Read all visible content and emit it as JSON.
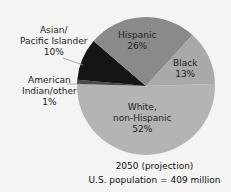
{
  "chart_data": {
    "type": "pie",
    "title": "2050 (projection)",
    "subtitle": "U.S. population = 409 million",
    "categories": [
      "White, non-Hispanic",
      "American Indian/other",
      "Asian/Pacific Islander",
      "Hispanic",
      "Black"
    ],
    "values": [
      52,
      1,
      10,
      26,
      13
    ],
    "unit": "%",
    "colors": [
      "#b4b4b4",
      "#4a4a4a",
      "#151515",
      "#8a8a8a",
      "#a9a9a9"
    ],
    "legend": "none (direct labels)"
  },
  "labels": {
    "white_line1": "White,",
    "white_line2": "non-Hispanic",
    "white_pct": "52%",
    "hispanic_line1": "Hispanic",
    "hispanic_pct": "26%",
    "black_line1": "Black",
    "black_pct": "13%",
    "asian_line1": "Asian/",
    "asian_line2": "Pacific Islander",
    "asian_pct": "10%",
    "amind_line1": "American",
    "amind_line2": "Indian/other",
    "amind_pct": "1%"
  },
  "caption": {
    "line1": "2050 (projection)",
    "line2": "U.S. population = 409 million"
  }
}
